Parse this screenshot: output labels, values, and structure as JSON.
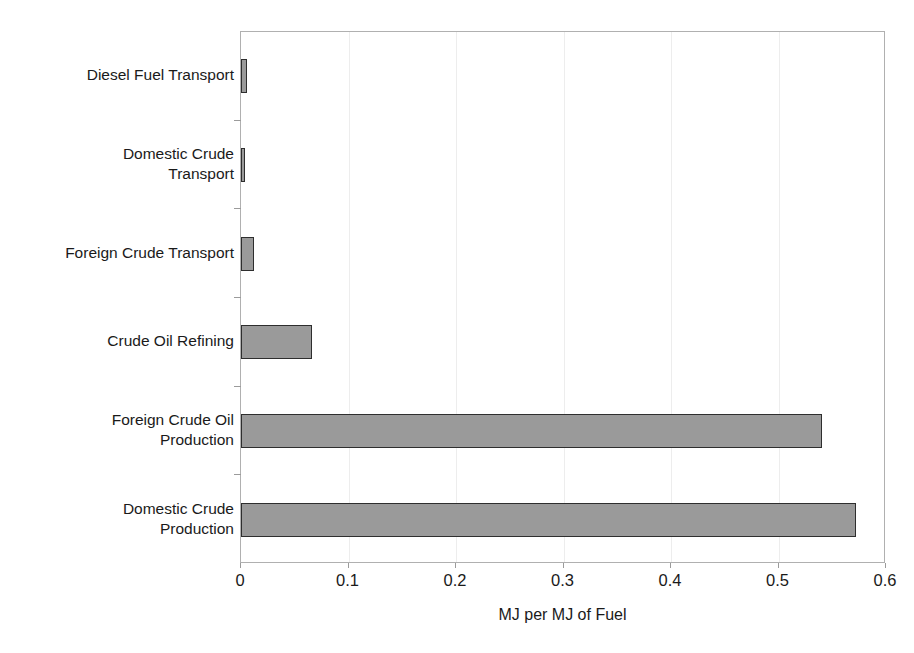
{
  "chart_data": {
    "type": "bar",
    "orientation": "horizontal",
    "title": "",
    "xlabel": "MJ per MJ of Fuel",
    "ylabel": "",
    "xlim": [
      0,
      0.6
    ],
    "xticks": [
      "0",
      "0.1",
      "0.2",
      "0.3",
      "0.4",
      "0.5",
      "0.6"
    ],
    "xtick_values": [
      0,
      0.1,
      0.2,
      0.3,
      0.4,
      0.5,
      0.6
    ],
    "grid": "vertical-light",
    "legend": "none",
    "categories": [
      "Diesel Fuel Transport",
      "Domestic Crude\nTransport",
      "Foreign Crude Transport",
      "Crude Oil Refining",
      "Foreign Crude Oil\nProduction",
      "Domestic Crude\nProduction"
    ],
    "values": [
      0.006,
      0.004,
      0.012,
      0.066,
      0.54,
      0.572
    ],
    "bar_color": "#9a9a9a",
    "bar_border_color": "#2e2e2e",
    "frame_color": "#b0b0b0",
    "gridline_color": "#ededed"
  }
}
